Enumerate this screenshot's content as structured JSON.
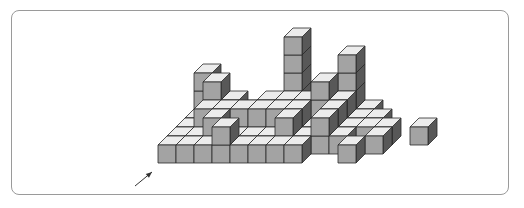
{
  "figure": {
    "colors": {
      "top": "#ececec",
      "front": "#a3a3a3",
      "side": "#585858",
      "edge": "#2a2a2a",
      "frame": "#9a9a9a"
    },
    "cube": {
      "size": 18,
      "depth_dx": 9,
      "depth_dy": -9,
      "origin_x": 158,
      "origin_y": 163
    },
    "arrow": {
      "from": [
        135,
        186
      ],
      "to": [
        152,
        172
      ]
    },
    "cubes": [
      [
        0,
        4,
        0
      ],
      [
        1,
        4,
        0
      ],
      [
        2,
        4,
        0
      ],
      [
        3,
        4,
        0
      ],
      [
        4,
        4,
        0
      ],
      [
        5,
        4,
        0
      ],
      [
        6,
        4,
        0
      ],
      [
        7,
        4,
        0
      ],
      [
        8,
        4,
        0
      ],
      [
        9,
        4,
        0
      ],
      [
        0,
        4,
        1
      ],
      [
        0,
        4,
        2
      ],
      [
        5,
        4,
        1
      ],
      [
        5,
        4,
        2
      ],
      [
        5,
        4,
        3
      ],
      [
        5,
        4,
        4
      ],
      [
        8,
        4,
        1
      ],
      [
        8,
        4,
        2
      ],
      [
        8,
        4,
        3
      ],
      [
        0,
        3,
        0
      ],
      [
        1,
        3,
        0
      ],
      [
        2,
        3,
        0
      ],
      [
        3,
        3,
        0
      ],
      [
        4,
        3,
        0
      ],
      [
        5,
        3,
        0
      ],
      [
        6,
        3,
        0
      ],
      [
        7,
        3,
        0
      ],
      [
        8,
        3,
        0
      ],
      [
        9,
        3,
        0
      ],
      [
        10,
        3,
        0
      ],
      [
        1,
        3,
        1
      ],
      [
        2,
        3,
        1
      ],
      [
        4,
        3,
        1
      ],
      [
        5,
        3,
        1
      ],
      [
        6,
        3,
        1
      ],
      [
        7,
        3,
        1
      ],
      [
        8,
        3,
        1
      ],
      [
        1,
        3,
        2
      ],
      [
        7,
        3,
        2
      ],
      [
        0,
        2,
        0
      ],
      [
        1,
        2,
        0
      ],
      [
        2,
        2,
        0
      ],
      [
        3,
        2,
        0
      ],
      [
        4,
        2,
        0
      ],
      [
        5,
        2,
        0
      ],
      [
        6,
        2,
        0
      ],
      [
        7,
        2,
        0
      ],
      [
        8,
        2,
        0
      ],
      [
        9,
        2,
        0
      ],
      [
        10,
        2,
        0
      ],
      [
        11,
        2,
        0
      ],
      [
        13,
        2,
        0
      ],
      [
        1,
        2,
        1
      ],
      [
        2,
        2,
        1
      ],
      [
        3,
        2,
        1
      ],
      [
        4,
        2,
        1
      ],
      [
        5,
        2,
        1
      ],
      [
        6,
        2,
        1
      ],
      [
        8,
        2,
        1
      ],
      [
        0,
        1,
        0
      ],
      [
        1,
        1,
        0
      ],
      [
        2,
        1,
        0
      ],
      [
        3,
        1,
        0
      ],
      [
        4,
        1,
        0
      ],
      [
        5,
        1,
        0
      ],
      [
        6,
        1,
        0
      ],
      [
        7,
        1,
        0
      ],
      [
        8,
        1,
        0
      ],
      [
        9,
        1,
        0
      ],
      [
        2,
        1,
        1
      ],
      [
        6,
        1,
        1
      ],
      [
        8,
        1,
        1
      ],
      [
        11,
        1,
        0
      ],
      [
        0,
        0,
        0
      ],
      [
        1,
        0,
        0
      ],
      [
        2,
        0,
        0
      ],
      [
        3,
        0,
        0
      ],
      [
        4,
        0,
        0
      ],
      [
        5,
        0,
        0
      ],
      [
        6,
        0,
        0
      ],
      [
        7,
        0,
        0
      ],
      [
        3,
        0,
        1
      ],
      [
        10,
        0,
        0
      ]
    ]
  }
}
